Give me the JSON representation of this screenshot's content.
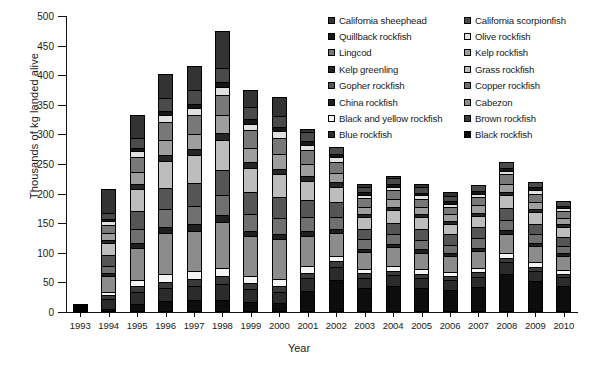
{
  "chart_data": {
    "type": "bar",
    "subtype": "stacked-bar",
    "title": "",
    "xlabel": "Year",
    "ylabel": "Thousands of kg landed alive",
    "ylim": [
      0,
      500
    ],
    "yticks": [
      0,
      50,
      100,
      150,
      200,
      250,
      300,
      350,
      400,
      450,
      500
    ],
    "grid": false,
    "legend_position": "top-right",
    "categories": [
      1993,
      1994,
      1995,
      1996,
      1997,
      1998,
      1999,
      2000,
      2001,
      2002,
      2003,
      2004,
      2005,
      2006,
      2007,
      2008,
      2009,
      2010
    ],
    "totals": [
      13,
      207,
      333,
      402,
      416,
      474,
      375,
      363,
      309,
      276,
      216,
      225,
      216,
      202,
      213,
      239,
      210,
      180
    ],
    "series": [
      {
        "name": "Black rockfish",
        "color": "#0d0d0d",
        "values": [
          0,
          3,
          12,
          16,
          18,
          18,
          14,
          12,
          36,
          56,
          43,
          46,
          42,
          40,
          44,
          68,
          55,
          48
        ]
      },
      {
        "name": "Blue rockfish",
        "color": "#2b2b2b",
        "values": [
          2,
          16,
          20,
          22,
          24,
          27,
          22,
          20,
          21,
          22,
          18,
          19,
          18,
          17,
          18,
          20,
          18,
          15
        ]
      },
      {
        "name": "Brown rockfish",
        "color": "#3a3a3a",
        "values": [
          0,
          6,
          9,
          10,
          10,
          12,
          9,
          9,
          9,
          9,
          7,
          7,
          7,
          6,
          7,
          7,
          6,
          5
        ]
      },
      {
        "name": "Black and yellow rockfish",
        "color": "#f4f4f4",
        "values": [
          0,
          5,
          9,
          13,
          13,
          14,
          11,
          11,
          10,
          8,
          7,
          8,
          7,
          7,
          7,
          8,
          7,
          6
        ]
      },
      {
        "name": "Cabezon",
        "color": "#8c8c8c",
        "values": [
          1,
          28,
          58,
          72,
          72,
          80,
          72,
          70,
          55,
          42,
          30,
          33,
          30,
          28,
          30,
          33,
          29,
          24
        ]
      },
      {
        "name": "China rockfish",
        "color": "#1f1f1f",
        "values": [
          0,
          4,
          7,
          9,
          10,
          11,
          8,
          8,
          7,
          6,
          5,
          5,
          5,
          4,
          5,
          5,
          4,
          4
        ]
      },
      {
        "name": "Copper rockfish",
        "color": "#707070",
        "values": [
          1,
          13,
          24,
          30,
          31,
          34,
          29,
          28,
          24,
          20,
          16,
          17,
          16,
          15,
          16,
          17,
          15,
          13
        ]
      },
      {
        "name": "Gopher rockfish",
        "color": "#555555",
        "values": [
          1,
          19,
          32,
          38,
          40,
          44,
          38,
          36,
          30,
          25,
          19,
          20,
          19,
          18,
          19,
          21,
          19,
          16
        ]
      },
      {
        "name": "Grass rockfish",
        "color": "#bdbdbd",
        "values": [
          1,
          22,
          38,
          46,
          48,
          52,
          43,
          41,
          34,
          28,
          21,
          22,
          21,
          19,
          21,
          23,
          20,
          17
        ]
      },
      {
        "name": "Kelp greenling",
        "color": "#262626",
        "values": [
          0,
          4,
          7,
          9,
          9,
          10,
          8,
          8,
          7,
          6,
          4,
          5,
          4,
          4,
          4,
          5,
          4,
          4
        ]
      },
      {
        "name": "Kelp rockfish",
        "color": "#9e9e9e",
        "values": [
          1,
          12,
          21,
          26,
          27,
          30,
          25,
          24,
          20,
          16,
          12,
          13,
          12,
          11,
          12,
          13,
          12,
          10
        ]
      },
      {
        "name": "Lingcod",
        "color": "#787878",
        "values": [
          1,
          14,
          25,
          31,
          32,
          35,
          30,
          29,
          24,
          19,
          14,
          15,
          14,
          13,
          14,
          16,
          14,
          12
        ]
      },
      {
        "name": "Olive rockfish",
        "color": "#e0e0e0",
        "values": [
          0,
          5,
          9,
          11,
          11,
          12,
          10,
          10,
          8,
          6,
          5,
          5,
          5,
          4,
          5,
          5,
          5,
          4
        ]
      },
      {
        "name": "Quillback rockfish",
        "color": "#161616",
        "values": [
          0,
          3,
          5,
          6,
          6,
          7,
          6,
          5,
          5,
          4,
          3,
          3,
          3,
          3,
          3,
          3,
          3,
          2
        ]
      },
      {
        "name": "California scorpionfish",
        "color": "#4a4a4a",
        "values": [
          1,
          9,
          17,
          21,
          22,
          24,
          20,
          19,
          15,
          12,
          9,
          9,
          9,
          8,
          9,
          10,
          9,
          7
        ]
      },
      {
        "name": "California sheephead",
        "color": "#333333",
        "values": [
          4,
          44,
          40,
          42,
          43,
          64,
          30,
          33,
          4,
          0,
          3,
          3,
          4,
          5,
          0,
          0,
          0,
          0
        ]
      }
    ]
  },
  "axes": {
    "ylabel": "Thousands of kg landed alive",
    "xlabel": "Year",
    "ytick_labels": [
      "500",
      "450",
      "400",
      "350",
      "300",
      "250",
      "200",
      "150",
      "100",
      "50",
      "0"
    ],
    "xtick_labels": [
      "1993",
      "1994",
      "1995",
      "1996",
      "1997",
      "1998",
      "1999",
      "2000",
      "2001",
      "2002",
      "2003",
      "2004",
      "2005",
      "2006",
      "2007",
      "2008",
      "2009",
      "2010"
    ]
  },
  "legend": {
    "column_left": [
      {
        "label": "California sheephead",
        "color": "#333333"
      },
      {
        "label": "Quillback rockfish",
        "color": "#161616"
      },
      {
        "label": "Lingcod",
        "color": "#787878"
      },
      {
        "label": "Kelp greenling",
        "color": "#262626"
      },
      {
        "label": "Gopher rockfish",
        "color": "#555555"
      },
      {
        "label": "China rockfish",
        "color": "#1f1f1f"
      },
      {
        "label": "Black and yellow rockfish",
        "color": "#f4f4f4"
      },
      {
        "label": "Blue rockfish",
        "color": "#2b2b2b"
      }
    ],
    "column_right": [
      {
        "label": "California scorpionfish",
        "color": "#4a4a4a"
      },
      {
        "label": "Olive rockfish",
        "color": "#e0e0e0"
      },
      {
        "label": "Kelp rockfish",
        "color": "#9e9e9e"
      },
      {
        "label": "Grass rockfish",
        "color": "#bdbdbd"
      },
      {
        "label": "Copper rockfish",
        "color": "#707070"
      },
      {
        "label": "Cabezon",
        "color": "#8c8c8c"
      },
      {
        "label": "Brown rockfish",
        "color": "#3a3a3a"
      },
      {
        "label": "Black rockfish",
        "color": "#0d0d0d"
      }
    ]
  }
}
